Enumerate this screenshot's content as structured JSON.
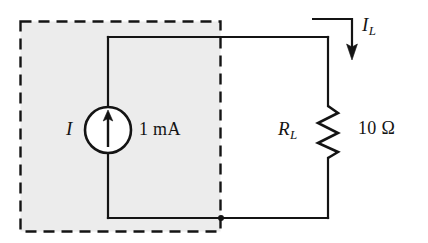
{
  "figure": {
    "type": "circuit-schematic",
    "labels": {
      "source_symbol": "I",
      "source_value": "1 mA",
      "load_symbol": "R",
      "load_symbol_subscript": "L",
      "load_value": "10 Ω",
      "load_current_symbol": "I",
      "load_current_subscript": "L"
    },
    "colors": {
      "wire": "#141414",
      "shaded_region": "#ececec",
      "dashed_border": "#141414",
      "background": "#ffffff"
    },
    "components": [
      {
        "name": "current-source",
        "symbol": "I",
        "value": "1 mA",
        "direction": "up"
      },
      {
        "name": "load-resistor",
        "symbol": "R_L",
        "value": "10 Ω"
      },
      {
        "name": "load-current-arrow",
        "symbol": "I_L",
        "direction": "down"
      }
    ],
    "annotations": {
      "dashed_box_meaning": "source network enclosure"
    }
  }
}
